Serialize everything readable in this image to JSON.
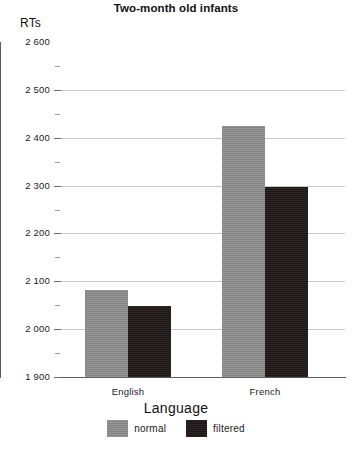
{
  "chart_data": {
    "type": "bar",
    "title": "Two-month old infants",
    "xlabel": "Language",
    "ylabel": "RTs",
    "categories": [
      "English",
      "French"
    ],
    "series": [
      {
        "name": "normal",
        "color": "#8a8a8a",
        "values": [
          2082,
          2425
        ]
      },
      {
        "name": "filtered",
        "color": "#241c1c",
        "values": [
          2049,
          2298
        ]
      }
    ],
    "ylim": [
      1900,
      2600
    ],
    "ytick_step": 100,
    "yminor_step": 50,
    "ytick_labels": [
      "2 600",
      "2 500",
      "2 400",
      "2 300",
      "2 200",
      "2 100",
      "2 000",
      "1 900"
    ],
    "ytick_values": [
      2600,
      2500,
      2400,
      2300,
      2200,
      2100,
      2000,
      1900
    ],
    "grid": true,
    "legend_position": "bottom"
  },
  "legend": {
    "items": [
      {
        "label": "normal"
      },
      {
        "label": "filtered"
      }
    ]
  }
}
